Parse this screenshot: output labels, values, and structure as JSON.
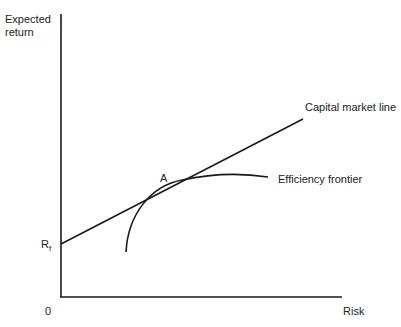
{
  "diagram": {
    "axes": {
      "y_label_line1": "Expected",
      "y_label_line2": "return",
      "x_label": "Risk",
      "origin_label": "0"
    },
    "points": {
      "rf_label": "R",
      "rf_subscript": "f",
      "tangent_label": "A"
    },
    "curves": {
      "cml_label": "Capital market line",
      "frontier_label": "Efficiency frontier"
    },
    "colors": {
      "line": "#1a1a1a",
      "text": "#222222",
      "background": "#ffffff"
    }
  }
}
